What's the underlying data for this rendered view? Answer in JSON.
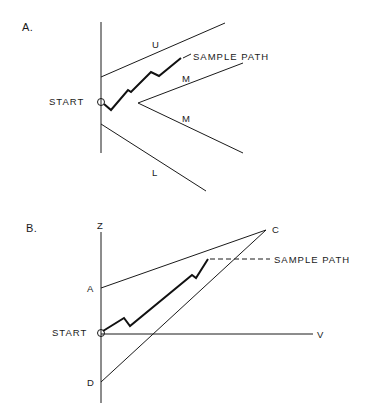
{
  "panel_a": {
    "label": "A.",
    "start_label": "START",
    "sample_path_label": "SAMPLE PATH",
    "boundary_labels": {
      "upper": "U",
      "middle_upper": "M",
      "middle_lower": "M",
      "lower": "L"
    }
  },
  "panel_b": {
    "label": "B.",
    "axis_z": "Z",
    "axis_v": "V",
    "point_a": "A",
    "point_c": "C",
    "point_d": "D",
    "start_label": "START",
    "sample_path_label": "SAMPLE PATH"
  }
}
